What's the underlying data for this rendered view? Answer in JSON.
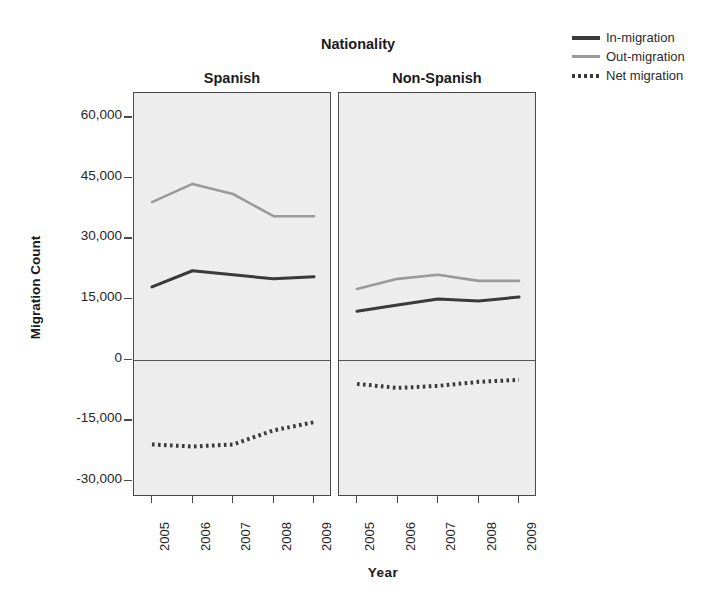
{
  "chart_data": {
    "type": "line",
    "title": "Nationality",
    "xlabel": "Year",
    "ylabel": "Migration Count",
    "x": [
      2005,
      2006,
      2007,
      2008,
      2009
    ],
    "categories": [
      "2005",
      "2006",
      "2007",
      "2008",
      "2009"
    ],
    "ylim": [
      -34000,
      66000
    ],
    "yticks": [
      60000,
      45000,
      30000,
      15000,
      0,
      -15000,
      -30000
    ],
    "ytick_labels": [
      "60,000",
      "45,000",
      "30,000",
      "15,000",
      "0",
      "-15,000",
      "-30,000"
    ],
    "grid": false,
    "legend_position": "top-right",
    "panels": [
      {
        "label": "Spanish",
        "series": [
          {
            "name": "In-migration",
            "values": [
              18000,
              22000,
              21000,
              20000,
              20500
            ]
          },
          {
            "name": "Out-migration",
            "values": [
              39000,
              43500,
              41000,
              35500,
              35500
            ]
          },
          {
            "name": "Net migration",
            "values": [
              -21000,
              -21500,
              -21000,
              -17500,
              -15500
            ]
          }
        ]
      },
      {
        "label": "Non-Spanish",
        "series": [
          {
            "name": "In-migration",
            "values": [
              12000,
              13500,
              15000,
              14500,
              15500
            ]
          },
          {
            "name": "Out-migration",
            "values": [
              17500,
              20000,
              21000,
              19500,
              19500
            ]
          },
          {
            "name": "Net migration",
            "values": [
              -6000,
              -7000,
              -6500,
              -5500,
              -5000
            ]
          }
        ]
      }
    ],
    "legend": [
      {
        "label": "In-migration",
        "style": "solid",
        "color": "#3a3a3a",
        "icon": "solid-line-icon"
      },
      {
        "label": "Out-migration",
        "style": "solid",
        "color": "#9a9a9a",
        "icon": "solid-line-icon"
      },
      {
        "label": "Net migration",
        "style": "dotted",
        "color": "#3a3a3a",
        "icon": "dotted-line-icon"
      }
    ],
    "colors": {
      "in_migration": "#3a3a3a",
      "out_migration": "#9a9a9a",
      "net_migration": "#3a3a3a",
      "panel_background": "#ededed",
      "panel_border": "#4a4a4a",
      "figure_background": "#ffffff"
    }
  }
}
